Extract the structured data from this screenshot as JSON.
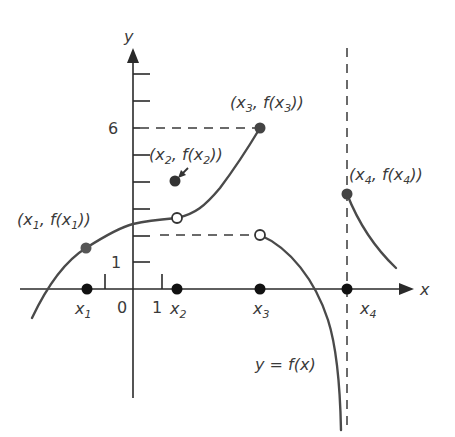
{
  "diagram": {
    "axes": {
      "x_label": "x",
      "y_label": "y",
      "origin_label": "0",
      "x_unit_label": "1",
      "y_unit_label": "1",
      "y_six_label": "6"
    },
    "x_points": [
      {
        "name": "x",
        "sub": "1"
      },
      {
        "name": "x",
        "sub": "2"
      },
      {
        "name": "x",
        "sub": "3"
      },
      {
        "name": "x",
        "sub": "4"
      }
    ],
    "point_labels": {
      "p1": {
        "open": "(x",
        "sub1": "1",
        "mid": ", f(x",
        "sub2": "1",
        "close": "))"
      },
      "p2": {
        "open": "(x",
        "sub1": "2",
        "mid": ", f(x",
        "sub2": "2",
        "close": "))"
      },
      "p3": {
        "open": "(x",
        "sub1": "3",
        "mid": ", f(x",
        "sub2": "3",
        "close": "))"
      },
      "p4": {
        "open": "(x",
        "sub1": "4",
        "mid": ", f(x",
        "sub2": "4",
        "close": "))"
      }
    },
    "function_label": "y = f(x)",
    "colors": {
      "axis": "#2a2a2a",
      "curve": "#4a4a4a",
      "point_filled": "#333333",
      "point_open_fill": "#ffffff"
    }
  }
}
